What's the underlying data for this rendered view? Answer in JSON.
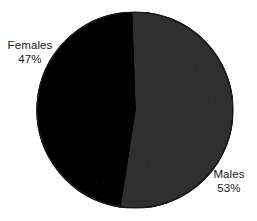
{
  "chart_data": {
    "type": "pie",
    "title": "",
    "subtitle": "",
    "xlabel": "",
    "ylabel": "",
    "legend_position": "none",
    "grid": false,
    "categories": [
      "Males",
      "Females"
    ],
    "values": [
      53,
      47
    ],
    "unit": "%",
    "slices": [
      {
        "name": "Males",
        "value": 53,
        "value_label": "53%",
        "color": "#707070",
        "label_position": "outside-bottom-right"
      },
      {
        "name": "Females",
        "value": 47,
        "value_label": "47%",
        "color": "#2e2e2e",
        "label_position": "outside-top-left"
      }
    ],
    "start_angle_deg": -2,
    "total": 100
  },
  "labels": {
    "females": {
      "name": "Females",
      "value": "47%"
    },
    "males": {
      "name": "Males",
      "value": "53%"
    }
  },
  "colors": {
    "background": "#ffffff",
    "dark_slice": "#2e2e2e",
    "light_slice": "#707070",
    "outline": "#1c1c1c",
    "text": "#1a1a1a"
  }
}
